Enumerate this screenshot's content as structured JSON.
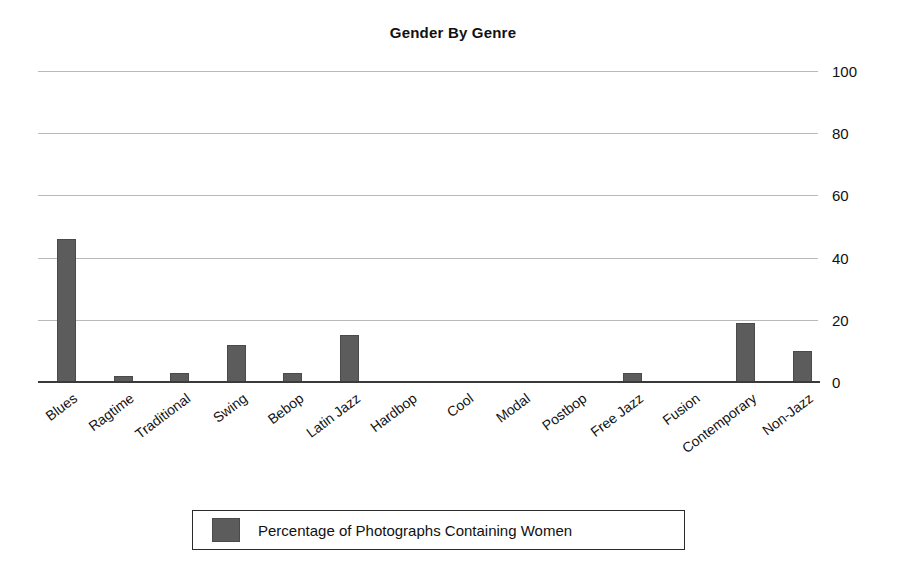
{
  "chart_data": {
    "type": "bar",
    "title": "Gender By Genre",
    "xlabel": "",
    "ylabel": "",
    "ylim": [
      0,
      100
    ],
    "yticks": [
      0,
      20,
      40,
      60,
      80,
      100
    ],
    "grid": true,
    "y_axis_position": "right",
    "legend_position": "bottom",
    "categories": [
      "Blues",
      "Ragtime",
      "Traditional",
      "Swing",
      "Bebop",
      "Latin Jazz",
      "Hardbop",
      "Cool",
      "Modal",
      "Postbop",
      "Free Jazz",
      "Fusion",
      "Contemporary",
      "Non-Jazz"
    ],
    "series": [
      {
        "name": "Percentage of Photographs Containing Women",
        "color": "#5c5c5c",
        "values": [
          46,
          2,
          3,
          12,
          3,
          15,
          0,
          0,
          0,
          0,
          3,
          0,
          19,
          10
        ]
      }
    ]
  },
  "legend": {
    "entries": [
      {
        "label": "Percentage of Photographs Containing Women",
        "color": "#5c5c5c"
      }
    ]
  },
  "colors": {
    "bar": "#5c5c5c",
    "gridline": "#b9b9b9",
    "axis": "#3a3a3a",
    "text": "#111111",
    "background": "#ffffff"
  }
}
